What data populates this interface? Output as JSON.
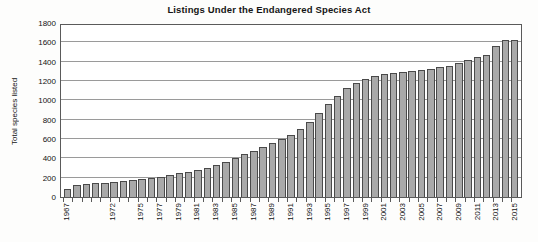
{
  "chart_data": {
    "type": "bar",
    "title": "Listings Under the Endangered Species Act",
    "xlabel": "",
    "ylabel": "Total species listed",
    "ylim": [
      0,
      1800
    ],
    "ytick_step": 200,
    "yticks": [
      0,
      200,
      400,
      600,
      800,
      1000,
      1200,
      1400,
      1600,
      1800
    ],
    "grid": true,
    "legend": "none",
    "bar_fill_color": "#a9a9a9",
    "bar_edge_color": "#4a4a4a",
    "categories": [
      "1967",
      "1968",
      "1969",
      "1970",
      "1971",
      "1972",
      "1973",
      "1974",
      "1975",
      "1976",
      "1977",
      "1978",
      "1979",
      "1980",
      "1981",
      "1982",
      "1983",
      "1984",
      "1985",
      "1986",
      "1987",
      "1988",
      "1989",
      "1990",
      "1991",
      "1992",
      "1993",
      "1994",
      "1995",
      "1996",
      "1997",
      "1998",
      "1999",
      "2000",
      "2001",
      "2002",
      "2003",
      "2004",
      "2005",
      "2006",
      "2007",
      "2008",
      "2009",
      "2010",
      "2011",
      "2012",
      "2013",
      "2014",
      "2015"
    ],
    "tick_label_years": [
      "1967",
      "1972",
      "1975",
      "1977",
      "1979",
      "1981",
      "1983",
      "1985",
      "1987",
      "1989",
      "1991",
      "1993",
      "1995",
      "1997",
      "1999",
      "2001",
      "2003",
      "2005",
      "2007",
      "2009",
      "2011",
      "2013",
      "2015"
    ],
    "values": [
      80,
      120,
      130,
      140,
      150,
      160,
      170,
      180,
      190,
      200,
      210,
      230,
      250,
      260,
      280,
      300,
      330,
      360,
      400,
      440,
      480,
      520,
      560,
      600,
      640,
      700,
      780,
      870,
      960,
      1050,
      1130,
      1180,
      1220,
      1250,
      1270,
      1280,
      1290,
      1300,
      1310,
      1320,
      1340,
      1360,
      1390,
      1420,
      1450,
      1470,
      1560,
      1620,
      1625
    ]
  }
}
